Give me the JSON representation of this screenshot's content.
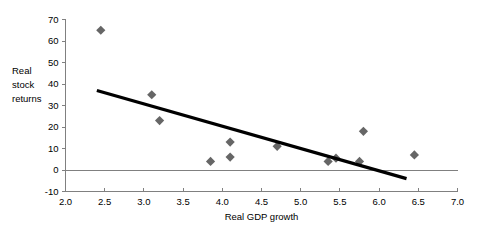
{
  "chart_data": {
    "type": "scatter",
    "title": "",
    "xlabel": "Real GDP growth",
    "ylabel": "Real stock returns",
    "ylabel_lines": [
      "Real",
      "stock",
      "returns"
    ],
    "xlim": [
      2.0,
      7.0
    ],
    "ylim": [
      -10,
      70
    ],
    "xticks": [
      2.0,
      2.5,
      3.0,
      3.5,
      4.0,
      4.5,
      5.0,
      5.5,
      6.0,
      6.5,
      7.0
    ],
    "xtick_labels": [
      "2.0",
      "2.5",
      "3.0",
      "3.5",
      "4.0",
      "4.5",
      "5.0",
      "5.5",
      "6.0",
      "6.5",
      "7.0"
    ],
    "yticks": [
      -10,
      0,
      10,
      20,
      30,
      40,
      50,
      60,
      70
    ],
    "ytick_labels": [
      "-10",
      "0",
      "10",
      "20",
      "30",
      "40",
      "50",
      "60",
      "70"
    ],
    "grid": false,
    "legend": "none",
    "marker_color": "#666666",
    "marker_shape": "diamond",
    "trendline_color": "#000000",
    "axis_color": "#808080",
    "points": [
      {
        "x": 2.45,
        "y": 65
      },
      {
        "x": 3.1,
        "y": 35
      },
      {
        "x": 3.2,
        "y": 23
      },
      {
        "x": 3.85,
        "y": 4
      },
      {
        "x": 4.1,
        "y": 13
      },
      {
        "x": 4.1,
        "y": 6
      },
      {
        "x": 4.7,
        "y": 11
      },
      {
        "x": 5.35,
        "y": 4
      },
      {
        "x": 5.45,
        "y": 5.5
      },
      {
        "x": 5.75,
        "y": 4
      },
      {
        "x": 5.8,
        "y": 18
      },
      {
        "x": 6.45,
        "y": 7
      }
    ],
    "trendline": {
      "x0": 2.4,
      "y0": 37,
      "x1": 6.35,
      "y1": -4
    }
  }
}
